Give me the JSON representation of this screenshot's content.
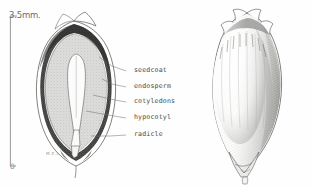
{
  "plate": {
    "title": "Seed anatomy plate",
    "background_color": "#fefefe",
    "ink_color": "#4a4a4a"
  },
  "scale": {
    "top_label": "3.5mm.",
    "bottom_label": "0",
    "unit": "mm",
    "length_value": "3.5"
  },
  "signature": {
    "text": "M.E.L."
  },
  "specimens": [
    {
      "name": "longitudinal-section",
      "caption": "seed longitudinal section"
    },
    {
      "name": "whole-seed",
      "caption": "whole seed exterior"
    }
  ],
  "callouts": [
    {
      "label": "seedcoat",
      "x": 134,
      "y": 70,
      "leader_x1": 126,
      "leader_y1": 72,
      "leader_x2": 100,
      "leader_y2": 58
    },
    {
      "label": "endosperm",
      "x": 134,
      "y": 86,
      "leader_x1": 126,
      "leader_y1": 88,
      "leader_x2": 103,
      "leader_y2": 80
    },
    {
      "label": "cotyledons",
      "x": 134,
      "y": 101,
      "leader_x1": 126,
      "leader_y1": 103,
      "leader_x2": 96,
      "leader_y2": 96
    },
    {
      "label": "hypocotyl",
      "x": 134,
      "y": 117,
      "leader_x1": 126,
      "leader_y1": 119,
      "leader_x2": 88,
      "leader_y2": 112
    },
    {
      "label": "radicle",
      "x": 134,
      "y": 134,
      "leader_x1": 126,
      "leader_y1": 136,
      "leader_x2": 92,
      "leader_y2": 136
    }
  ],
  "colors": {
    "seedcoat_dark": "#3b3b3b",
    "endosperm_fill": "#d8d8d6",
    "embryo_fill": "#fbfbfb",
    "outline": "#555555",
    "label_text": "#4a4a4a",
    "scale_text": "#6d6d6d"
  }
}
